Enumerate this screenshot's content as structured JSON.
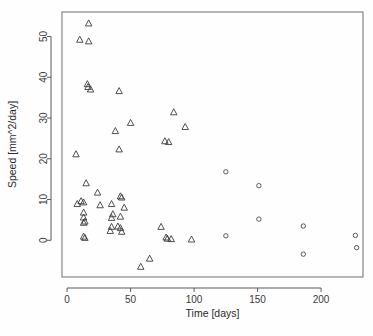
{
  "chart_data": {
    "type": "scatter",
    "title": "",
    "xlabel": "Time [days]",
    "ylabel": "Speed [mm^2/day]",
    "xlim": [
      -4,
      233
    ],
    "ylim": [
      -9,
      56
    ],
    "grid": false,
    "legend": "none",
    "xticks": [
      0,
      50,
      100,
      150,
      200
    ],
    "xticklabels": [
      "0",
      "50",
      "100",
      "150",
      "200"
    ],
    "yticks": [
      0,
      10,
      20,
      30,
      40,
      50
    ],
    "yticklabels": [
      "0",
      "10",
      "20",
      "30",
      "40",
      "50"
    ],
    "series": [
      {
        "name": "triangles",
        "marker": "triangle",
        "color": "#3c3c3c",
        "points": [
          [
            17,
            53.2
          ],
          [
            10,
            49.2
          ],
          [
            17,
            48.8
          ],
          [
            16,
            38.3
          ],
          [
            16.5,
            37.6
          ],
          [
            18.5,
            37.0
          ],
          [
            41,
            36.6
          ],
          [
            84,
            31.4
          ],
          [
            93,
            27.8
          ],
          [
            50,
            28.8
          ],
          [
            38,
            26.8
          ],
          [
            77,
            24.3
          ],
          [
            80,
            24.1
          ],
          [
            41,
            22.3
          ],
          [
            7,
            21.1
          ],
          [
            15,
            14.0
          ],
          [
            24,
            11.7
          ],
          [
            42,
            10.8
          ],
          [
            43,
            10.5
          ],
          [
            11,
            9.6
          ],
          [
            13,
            9.3
          ],
          [
            8,
            8.9
          ],
          [
            26,
            8.6
          ],
          [
            35,
            8.9
          ],
          [
            45,
            8.0
          ],
          [
            13,
            6.8
          ],
          [
            36,
            6.4
          ],
          [
            13,
            5.6
          ],
          [
            35,
            5.5
          ],
          [
            42,
            5.8
          ],
          [
            14,
            4.6
          ],
          [
            13,
            4.3
          ],
          [
            35,
            3.3
          ],
          [
            40,
            3.4
          ],
          [
            42,
            3.0
          ],
          [
            74,
            3.3
          ],
          [
            34,
            2.3
          ],
          [
            43,
            2.1
          ],
          [
            13,
            0.9
          ],
          [
            14,
            0.6
          ],
          [
            78,
            0.7
          ],
          [
            79,
            0.4
          ],
          [
            82,
            0.3
          ],
          [
            98,
            0.2
          ],
          [
            65,
            -4.5
          ],
          [
            58,
            -6.5
          ]
        ]
      },
      {
        "name": "circles",
        "marker": "circle",
        "color": "#4a4a4a",
        "points": [
          [
            125,
            16.8
          ],
          [
            151,
            13.4
          ],
          [
            151,
            5.2
          ],
          [
            125,
            1.1
          ],
          [
            186,
            3.5
          ],
          [
            186,
            -3.4
          ],
          [
            227,
            1.2
          ],
          [
            228,
            -1.8
          ]
        ]
      }
    ]
  },
  "geometry": {
    "plot_left": 62,
    "plot_right": 363,
    "plot_top": 12,
    "plot_bottom": 277
  }
}
